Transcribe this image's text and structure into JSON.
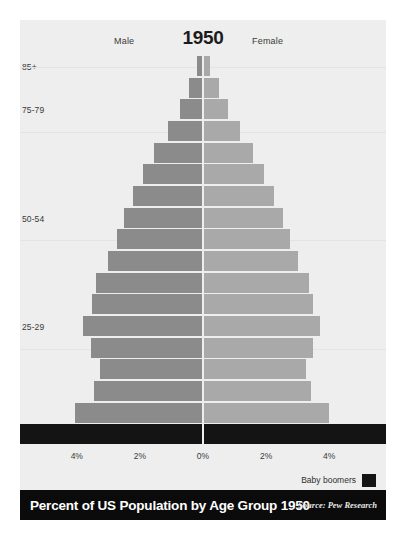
{
  "card": {
    "year": "1950",
    "male_label": "Male",
    "female_label": "Female"
  },
  "legend": {
    "label": "Baby boomers",
    "swatch_color": "#141414"
  },
  "footer": {
    "title": "Percent of US Population by Age Group 1950",
    "source": "Source: Pew Research"
  },
  "colors": {
    "background": "#edeeed",
    "male_bar": "#8b8b8b",
    "female_bar": "#a9a9a9",
    "highlight_bar": "#141414",
    "footer_bg": "#0b0b0b",
    "gridline": "#e3e4e3"
  },
  "chart_data": {
    "type": "bar",
    "subtype": "population-pyramid",
    "title": "Percent of US Population by Age Group 1950",
    "xlabel": "",
    "ylabel": "",
    "xlim": [
      -5.8,
      5.8
    ],
    "xticks": [
      -4,
      -2,
      0,
      2,
      4
    ],
    "xticklabels": [
      "4%",
      "2%",
      "0%",
      "2%",
      "4%"
    ],
    "grid": true,
    "legend_position": "bottom-right",
    "visible_ytick_labels": [
      "85+",
      "75-79",
      "50-54",
      "25-29",
      "0"
    ],
    "categories": [
      "85+",
      "80-84",
      "75-79",
      "70-74",
      "65-69",
      "60-64",
      "55-59",
      "50-54",
      "45-49",
      "40-44",
      "35-39",
      "30-34",
      "25-29",
      "20-24",
      "15-19",
      "10-14",
      "5-9",
      "0-4"
    ],
    "series": [
      {
        "name": "Male",
        "color": "#8b8b8b",
        "values": [
          0.18,
          0.45,
          0.72,
          1.12,
          1.55,
          1.9,
          2.22,
          2.5,
          2.72,
          3.0,
          3.38,
          3.52,
          3.8,
          3.55,
          3.28,
          3.45,
          4.05,
          5.65
        ]
      },
      {
        "name": "Female",
        "color": "#a9a9a9",
        "values": [
          0.22,
          0.52,
          0.8,
          1.18,
          1.6,
          1.92,
          2.25,
          2.52,
          2.75,
          3.02,
          3.35,
          3.48,
          3.72,
          3.5,
          3.25,
          3.42,
          4.0,
          5.65
        ]
      }
    ],
    "highlight": {
      "label": "Baby boomers",
      "categories": [
        "0-4"
      ],
      "color": "#141414"
    }
  }
}
